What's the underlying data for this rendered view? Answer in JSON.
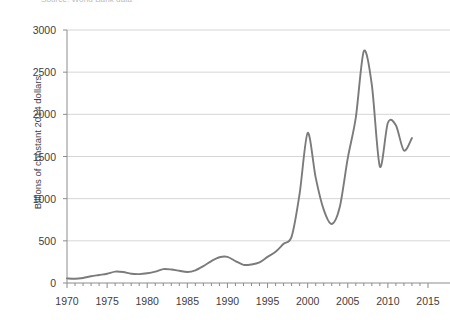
{
  "caption": {
    "source_note": "Source: World Bank data"
  },
  "chart_data": {
    "type": "line",
    "title": "",
    "xlabel": "",
    "ylabel": "Billions of constant 2014 dollars",
    "xlim": [
      1970,
      2015
    ],
    "ylim": [
      0,
      3000
    ],
    "grid": true,
    "legend": false,
    "line_color": "#7b7b7b",
    "grid_color": "#d6d6d6",
    "axis_color": "#8c8c8c",
    "xticks": [
      1970,
      1975,
      1980,
      1985,
      1990,
      1995,
      2000,
      2005,
      2010,
      2015
    ],
    "xtick_labels": [
      "1970",
      "1975",
      "1980",
      "1985",
      "1990",
      "1995",
      "2000",
      "2005",
      "2010",
      "2015"
    ],
    "yticks": [
      0,
      500,
      1000,
      1500,
      2000,
      2500,
      3000
    ],
    "ytick_labels": [
      "0",
      "500",
      "1000",
      "1500",
      "2000",
      "2500",
      "3000"
    ],
    "series": [
      {
        "name": "Global flows",
        "x": [
          1970,
          1971,
          1972,
          1973,
          1974,
          1975,
          1976,
          1977,
          1978,
          1979,
          1980,
          1981,
          1982,
          1983,
          1984,
          1985,
          1986,
          1987,
          1988,
          1989,
          1990,
          1991,
          1992,
          1993,
          1994,
          1995,
          1996,
          1997,
          1998,
          1999,
          2000,
          2001,
          2002,
          2003,
          2004,
          2005,
          2006,
          2007,
          2008,
          2009,
          2010,
          2011,
          2012,
          2013
        ],
        "values": [
          55,
          50,
          60,
          80,
          95,
          110,
          135,
          130,
          110,
          105,
          115,
          135,
          165,
          160,
          145,
          130,
          150,
          200,
          260,
          305,
          310,
          260,
          215,
          220,
          245,
          310,
          370,
          465,
          550,
          1060,
          1780,
          1250,
          870,
          700,
          900,
          1480,
          1960,
          2750,
          2350,
          1380,
          1900,
          1870,
          1570,
          1720
        ]
      }
    ]
  }
}
